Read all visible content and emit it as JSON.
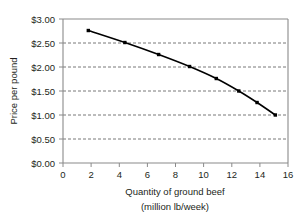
{
  "chart_data": {
    "type": "line",
    "title": "",
    "xlabel": "Quantity of ground beef (million lb/week)",
    "xlabel_line1": "Quantity of ground beef",
    "xlabel_line2": "(million lb/week)",
    "ylabel": "Price per pound",
    "xlim": [
      0,
      16
    ],
    "ylim": [
      0,
      3.0
    ],
    "xticks": [
      0,
      2,
      4,
      6,
      8,
      10,
      12,
      14,
      16
    ],
    "xticklabels": [
      "0",
      "2",
      "4",
      "6",
      "8",
      "10",
      "12",
      "14",
      "16"
    ],
    "yticks": [
      0,
      0.5,
      1.0,
      1.5,
      2.0,
      2.5,
      3.0
    ],
    "yticklabels": [
      "$0.00",
      "$0.50",
      "$1.00",
      "$1.50",
      "$2.00",
      "$2.50",
      "$3.00"
    ],
    "grid": "horizontal-dashed",
    "legend": "none",
    "series": [
      {
        "name": "Demand for ground beef",
        "marker": "filled-square",
        "color": "#000000",
        "x": [
          1.8,
          4.4,
          6.8,
          9.0,
          10.9,
          12.5,
          13.8,
          15.1
        ],
        "y": [
          2.76,
          2.51,
          2.26,
          2.01,
          1.76,
          1.5,
          1.26,
          1.0
        ],
        "points": [
          {
            "x": 1.8,
            "y": 2.76
          },
          {
            "x": 4.4,
            "y": 2.51
          },
          {
            "x": 6.8,
            "y": 2.26
          },
          {
            "x": 9.0,
            "y": 2.01
          },
          {
            "x": 10.9,
            "y": 1.76
          },
          {
            "x": 12.5,
            "y": 1.5
          },
          {
            "x": 13.8,
            "y": 1.26
          },
          {
            "x": 15.1,
            "y": 1.0
          }
        ]
      }
    ]
  },
  "style": {
    "line_color": "#000000",
    "marker_color": "#000000",
    "grid_color": "#555555",
    "axis_color": "#8a8a8a",
    "text_color": "#231f20",
    "background": "#ffffff"
  }
}
